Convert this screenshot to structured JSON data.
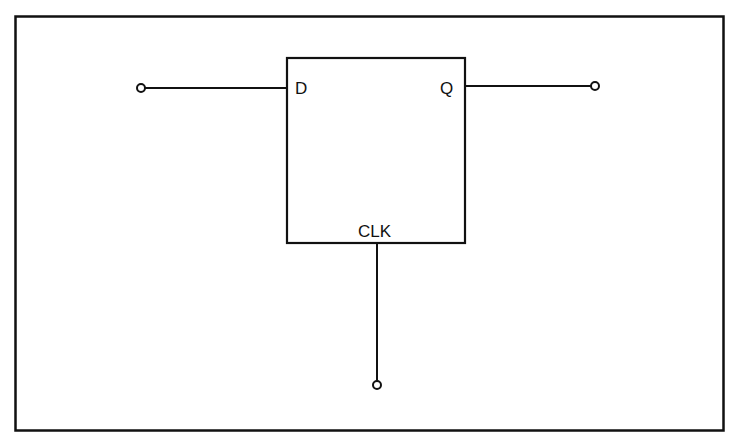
{
  "diagram": {
    "type": "D flip-flop block",
    "colors": {
      "stroke": "#111111",
      "background": "#ffffff"
    },
    "block": {
      "labels": {
        "d": "D",
        "q": "Q",
        "clk": "CLK"
      }
    },
    "terminals": [
      {
        "name": "D input",
        "side": "left"
      },
      {
        "name": "Q output",
        "side": "right"
      },
      {
        "name": "CLK input",
        "side": "bottom"
      }
    ]
  }
}
